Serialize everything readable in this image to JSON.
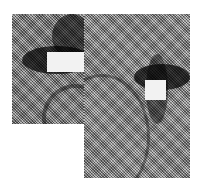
{
  "image": {
    "description": "Dithered grayscale composite of two overlapping photo crops, each showing a close-up with a dark elongated shape partially covered by a white rectangular mask",
    "background": "#ffffff",
    "panels": [
      {
        "name": "left",
        "x": 12,
        "y": 14,
        "w": 72,
        "h": 110,
        "mask": {
          "x": 35,
          "y": 38,
          "w": 38,
          "h": 20
        }
      },
      {
        "name": "right",
        "x": 84,
        "y": 14,
        "w": 106,
        "h": 164,
        "mask": {
          "x": 143,
          "y": 68,
          "w": 21,
          "h": 20
        }
      }
    ]
  }
}
